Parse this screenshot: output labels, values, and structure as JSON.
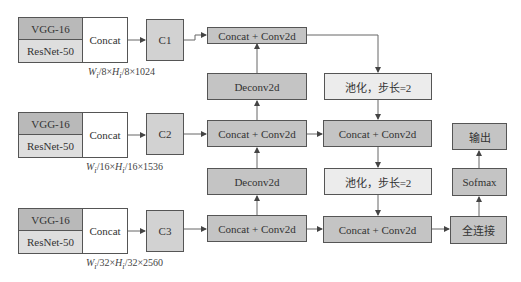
{
  "diagram": {
    "backbones": [
      {
        "top": "VGG-16",
        "bottom": "ResNet-50",
        "merge": "Concat",
        "feature": "C1",
        "dims": "W/8×H/8×1024"
      },
      {
        "top": "VGG-16",
        "bottom": "ResNet-50",
        "merge": "Concat",
        "feature": "C2",
        "dims": "W/16×H/16×1536"
      },
      {
        "top": "VGG-16",
        "bottom": "ResNet-50",
        "merge": "Concat",
        "feature": "C3",
        "dims": "W/32×H/32×2560"
      }
    ],
    "dims_parts": [
      {
        "w": "W",
        "sub": "i",
        "a": "/8×",
        "h": "H",
        "b": "/8×1024"
      },
      {
        "w": "W",
        "sub": "i",
        "a": "/16×",
        "h": "H",
        "b": "/16×1536"
      },
      {
        "w": "W",
        "sub": "i",
        "a": "/32×",
        "h": "H",
        "b": "/32×2560"
      }
    ],
    "topdown": {
      "fuse1": "Concat + Conv2d",
      "deconv1": "Deconv2d",
      "fuse2": "Concat + Conv2d",
      "deconv2": "Deconv2d",
      "fuse3": "Concat + Conv2d"
    },
    "bottomup": {
      "pool1": "池化，步长=2",
      "fuse2": "Concat + Conv2d",
      "pool2": "池化，步长=2",
      "fuse3": "Concat + Conv2d"
    },
    "head": {
      "fc": "全连接",
      "softmax": "Sofmax",
      "output": "输出"
    },
    "colors": {
      "dark": "#c4c4c4",
      "light": "#ececec",
      "vgg": "#b9b9b9",
      "resnet": "#dedede",
      "line": "#555555"
    }
  }
}
